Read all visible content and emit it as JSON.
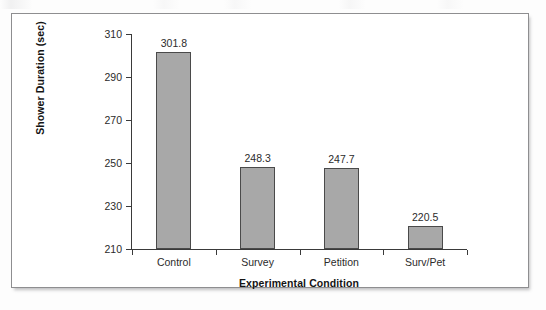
{
  "figure": {
    "frame_border_color": "#8e8e90",
    "background_color": "#ffffff"
  },
  "chart_data": {
    "type": "bar",
    "title": "",
    "subtitle": "",
    "xlabel": "Experimental Condition",
    "ylabel": "Shower Duration (sec)",
    "categories": [
      "Control",
      "Survey",
      "Petition",
      "Surv/Pet"
    ],
    "values": [
      301.8,
      248.3,
      247.7,
      220.5
    ],
    "value_labels": [
      "301.8",
      "248.3",
      "247.7",
      "220.5"
    ],
    "ylim": [
      210,
      310
    ],
    "yticks": [
      210,
      230,
      250,
      270,
      290,
      310
    ],
    "ytick_labels": [
      "210",
      "230",
      "250",
      "270",
      "290",
      "310"
    ],
    "grid": false,
    "legend": false,
    "legend_position": "none",
    "bar_color": "#a8a8a8",
    "bar_edge_color": "#4a4a4a",
    "axis_color": "#3a3a3a",
    "text_color": "#2b2b2b"
  }
}
